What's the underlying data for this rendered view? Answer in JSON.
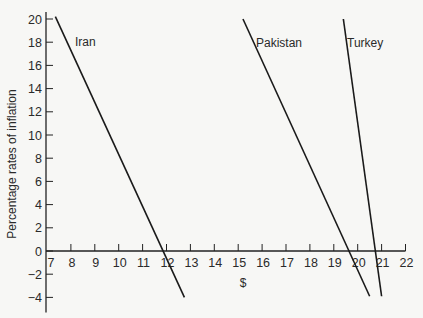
{
  "chart_data": {
    "type": "line",
    "title": "",
    "xlabel": "$",
    "ylabel": "Percentage rates of inflation",
    "xlim": [
      7,
      22
    ],
    "ylim": [
      -5,
      20
    ],
    "x_ticks": [
      7,
      8,
      9,
      10,
      11,
      12,
      13,
      14,
      15,
      16,
      17,
      18,
      19,
      20,
      21,
      22
    ],
    "y_ticks": [
      -4,
      -2,
      0,
      2,
      4,
      6,
      8,
      10,
      12,
      14,
      16,
      18,
      20
    ],
    "grid": false,
    "legend": "inline labels",
    "series": [
      {
        "name": "Iran",
        "points": [
          [
            7.35,
            20.2
          ],
          [
            12.75,
            -4.0
          ]
        ]
      },
      {
        "name": "Pakistan",
        "points": [
          [
            15.2,
            20.0
          ],
          [
            20.5,
            -3.9
          ]
        ]
      },
      {
        "name": "Turkey",
        "points": [
          [
            19.4,
            20.0
          ],
          [
            21.0,
            -3.9
          ]
        ]
      }
    ]
  }
}
